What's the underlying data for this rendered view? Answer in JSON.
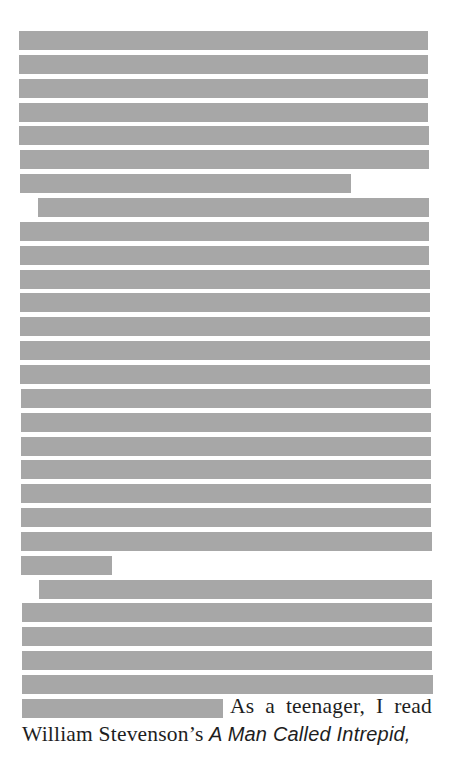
{
  "document": {
    "redaction_color": "#a7a7a7",
    "redacted_lines": [
      {
        "type": "full"
      },
      {
        "type": "full"
      },
      {
        "type": "full"
      },
      {
        "type": "full"
      },
      {
        "type": "full"
      },
      {
        "type": "full"
      },
      {
        "type": "partial",
        "fraction": 0.81
      },
      {
        "type": "indent"
      },
      {
        "type": "full"
      },
      {
        "type": "full"
      },
      {
        "type": "full"
      },
      {
        "type": "full"
      },
      {
        "type": "full"
      },
      {
        "type": "full"
      },
      {
        "type": "full"
      },
      {
        "type": "full"
      },
      {
        "type": "full"
      },
      {
        "type": "full"
      },
      {
        "type": "full"
      },
      {
        "type": "full"
      },
      {
        "type": "full"
      },
      {
        "type": "full"
      },
      {
        "type": "partial",
        "fraction": 0.22
      },
      {
        "type": "indent"
      },
      {
        "type": "full"
      },
      {
        "type": "full"
      },
      {
        "type": "full"
      },
      {
        "type": "full"
      },
      {
        "type": "partial",
        "fraction": 0.49
      }
    ],
    "visible_text": {
      "line1": "As a teenager, I read",
      "line2_prefix": "William Stevenson’s ",
      "line2_title": "A Man Called Intrepid,"
    }
  }
}
